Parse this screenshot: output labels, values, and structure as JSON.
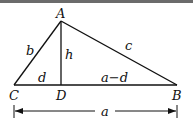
{
  "diagram": {
    "type": "triangle-with-altitude",
    "vertices": {
      "A": {
        "label": "A"
      },
      "B": {
        "label": "B"
      },
      "C": {
        "label": "C"
      },
      "D": {
        "label": "D"
      }
    },
    "sides": {
      "b": "b",
      "c": "c",
      "h": "h",
      "d": "d",
      "a_minus_d": "a−d",
      "a": "a"
    },
    "colors": {
      "stroke": "#111111",
      "background": "#ffffff",
      "top_border": "#6b6b6b"
    }
  }
}
